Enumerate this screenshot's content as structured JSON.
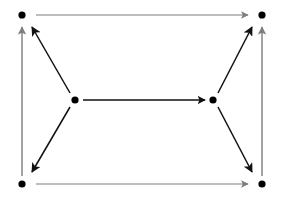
{
  "diagram": {
    "type": "directed-graph",
    "canvas": {
      "width": 282,
      "height": 199,
      "background": "#ffffff"
    },
    "colors": {
      "node": "#000000",
      "perimeter_edge": "#7d7d7d",
      "inner_edge": "#111111"
    },
    "nodes": [
      {
        "id": "top-left",
        "label": "",
        "x": 22,
        "y": 15,
        "radius": 3.6
      },
      {
        "id": "top-right",
        "label": "",
        "x": 262,
        "y": 15,
        "radius": 3.6
      },
      {
        "id": "middle-left",
        "label": "",
        "x": 75,
        "y": 100,
        "radius": 3.6
      },
      {
        "id": "middle-right",
        "label": "",
        "x": 213,
        "y": 100,
        "radius": 3.6
      },
      {
        "id": "bottom-left",
        "label": "",
        "x": 22,
        "y": 184,
        "radius": 3.6
      },
      {
        "id": "bottom-right",
        "label": "",
        "x": 262,
        "y": 184,
        "radius": 3.6
      }
    ],
    "edges": [
      {
        "id": "edge-top",
        "from": "top-left",
        "to": "top-right",
        "x1": 36,
        "y1": 15,
        "x2": 248,
        "y2": 15,
        "color": "#7d7d7d",
        "width": 1.1,
        "arrow": "end"
      },
      {
        "id": "edge-bottom",
        "from": "bottom-left",
        "to": "bottom-right",
        "x1": 36,
        "y1": 184,
        "x2": 248,
        "y2": 184,
        "color": "#7d7d7d",
        "width": 1.1,
        "arrow": "end"
      },
      {
        "id": "edge-left",
        "from": "bottom-left",
        "to": "top-left",
        "x1": 22,
        "y1": 176,
        "x2": 22,
        "y2": 27,
        "color": "#7d7d7d",
        "width": 1.4,
        "arrow": "end"
      },
      {
        "id": "edge-right",
        "from": "bottom-right",
        "to": "top-right",
        "x1": 262,
        "y1": 176,
        "x2": 262,
        "y2": 27,
        "color": "#7d7d7d",
        "width": 1.4,
        "arrow": "end"
      },
      {
        "id": "edge-middle",
        "from": "middle-left",
        "to": "middle-right",
        "x1": 83,
        "y1": 100,
        "x2": 205,
        "y2": 100,
        "color": "#111111",
        "width": 1.3,
        "arrow": "end"
      },
      {
        "id": "edge-upper-left",
        "from": "middle-left",
        "to": "top-left",
        "x1": 70,
        "y1": 93,
        "x2": 32,
        "y2": 27,
        "color": "#111111",
        "width": 1.5,
        "arrow": "end"
      },
      {
        "id": "edge-upper-right",
        "from": "middle-right",
        "to": "top-right",
        "x1": 218,
        "y1": 93,
        "x2": 252,
        "y2": 27,
        "color": "#111111",
        "width": 1.5,
        "arrow": "end"
      },
      {
        "id": "edge-lower-left",
        "from": "middle-left",
        "to": "bottom-left",
        "x1": 70,
        "y1": 107,
        "x2": 32,
        "y2": 172,
        "color": "#111111",
        "width": 1.5,
        "arrow": "end"
      },
      {
        "id": "edge-lower-right",
        "from": "middle-right",
        "to": "bottom-right",
        "x1": 218,
        "y1": 107,
        "x2": 252,
        "y2": 172,
        "color": "#111111",
        "width": 1.5,
        "arrow": "end"
      }
    ]
  }
}
